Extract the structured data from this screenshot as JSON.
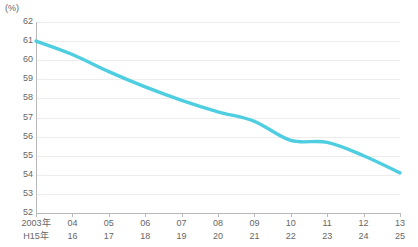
{
  "chart_data": {
    "type": "line",
    "title": "",
    "subtitle": "",
    "unit_label": "(%)",
    "xlabel": "",
    "ylabel": "",
    "ylim": [
      52,
      62
    ],
    "yticks": [
      62,
      61,
      60,
      59,
      58,
      57,
      56,
      55,
      54,
      53,
      52
    ],
    "grid": true,
    "legend": "none",
    "line_color": "#4ECEE0",
    "grid_color": "#ededed",
    "axis_color": "#b9b9b9",
    "text_color": "#666666",
    "categories": [
      "2003年",
      "04",
      "05",
      "06",
      "07",
      "08",
      "09",
      "10",
      "11",
      "12",
      "13"
    ],
    "categories_secondary": [
      "H15年",
      "16",
      "17",
      "18",
      "19",
      "20",
      "21",
      "22",
      "23",
      "24",
      "25"
    ],
    "series": [
      {
        "name": "",
        "values": [
          61.0,
          60.3,
          59.4,
          58.6,
          57.9,
          57.3,
          56.8,
          55.8,
          55.7,
          55.0,
          54.1
        ]
      }
    ]
  }
}
